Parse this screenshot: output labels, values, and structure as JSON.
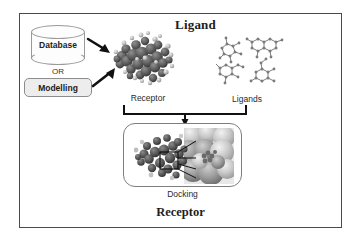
{
  "figure": {
    "title_top": "Ligand",
    "title_bottom": "Receptor",
    "source_database": {
      "label": "Database",
      "shape": "cylinder-icon"
    },
    "separator_label": "OR",
    "source_modelling": {
      "label": "Modelling",
      "shape": "rounded-box"
    },
    "receptor": {
      "label": "Receptor",
      "representation": "space-filling-protein-blob",
      "color": "#5d5d5d"
    },
    "ligands": {
      "label": "Ligands",
      "representation": "ball-and-stick-molecules",
      "count": 4,
      "color": "#6a6a6a"
    },
    "docking": {
      "label": "Docking",
      "representation": "docking-complex-with-zoom-inset"
    },
    "arrows": [
      {
        "name": "database-to-receptor",
        "direction": "down-right"
      },
      {
        "name": "modelling-to-receptor",
        "direction": "up-right"
      },
      {
        "name": "bracket-to-docking",
        "direction": "down"
      }
    ],
    "colors": {
      "border": "#4a4a4a",
      "box_fill": "#ededed",
      "text": "#1d1d1d",
      "arrow": "#111111"
    }
  }
}
